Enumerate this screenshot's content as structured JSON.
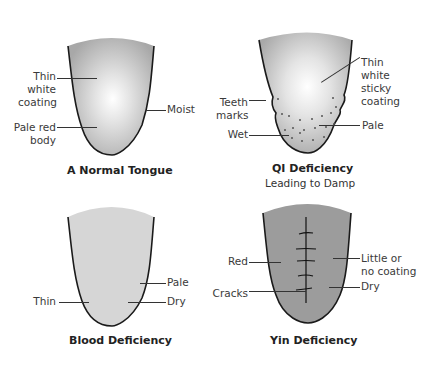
{
  "diagrams": [
    {
      "id": "normal",
      "title": "A Normal Tongue",
      "fill": "#b8b8b8",
      "labels": {
        "coating": "Thin\nwhite\ncoating",
        "body": "Pale red\nbody",
        "moist": "Moist"
      }
    },
    {
      "id": "qi",
      "title": "QI Deficiency",
      "subtitle": "Leading to Damp",
      "fill": "#bdbdbd",
      "labels": {
        "teeth": "Teeth\nmarks",
        "wet": "Wet",
        "coating": "Thin\nwhite\nsticky\ncoating",
        "pale": "Pale"
      }
    },
    {
      "id": "blood",
      "title": "Blood Deficiency",
      "fill": "#d4d4d4",
      "labels": {
        "thin": "Thin",
        "pale": "Pale",
        "dry": "Dry"
      }
    },
    {
      "id": "yin",
      "title": "Yin Deficiency",
      "fill": "#9a9a9a",
      "labels": {
        "red": "Red",
        "cracks": "Cracks",
        "coating": "Little or\nno coating",
        "dry": "Dry"
      }
    }
  ]
}
